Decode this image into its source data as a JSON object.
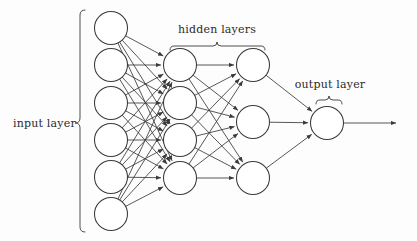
{
  "figure": {
    "background_color": "#fdfdfd",
    "stroke_color": "#3a3a3a",
    "node_fill": "#ffffff",
    "text_color": "#2b2b2b",
    "width": 417,
    "height": 241
  },
  "labels": {
    "input_layer": "input layer",
    "hidden_layers": "hidden layers",
    "output_layer": "output layer"
  },
  "chart_data": {
    "type": "diagram",
    "layers": [
      {
        "name": "input layer",
        "label": "input layer",
        "node_count": 6,
        "cx": 111,
        "radius": 16.5,
        "node_y": [
          28,
          65,
          103,
          140,
          177,
          214
        ]
      },
      {
        "name": "hidden layer 1",
        "label": "hidden layers",
        "node_count": 4,
        "cx": 180,
        "radius": 16.5,
        "node_y": [
          65,
          103,
          140,
          178
        ]
      },
      {
        "name": "hidden layer 2",
        "label": "hidden layers",
        "node_count": 3,
        "cx": 253,
        "radius": 16.5,
        "node_y": [
          65,
          122,
          178
        ]
      },
      {
        "name": "output layer",
        "label": "output layer",
        "node_count": 1,
        "cx": 327,
        "radius": 16.5,
        "node_y": [
          123
        ]
      }
    ],
    "connections": [
      {
        "from": "input layer",
        "to": "hidden layer 1",
        "pattern": "fully-connected",
        "edge_count": 24
      },
      {
        "from": "hidden layer 1",
        "to": "hidden layer 2",
        "pattern": "fully-connected",
        "edge_count": 12
      },
      {
        "from": "hidden layer 2",
        "to": "output layer",
        "pattern": "fully-connected",
        "edge_count": 3
      }
    ],
    "output_arrow": {
      "from_x": 344,
      "to_x": 396,
      "y": 123
    },
    "braces": [
      {
        "name": "input layer brace",
        "orientation": "vertical",
        "x": 80,
        "y1": 10,
        "y2": 232,
        "tip": 123
      },
      {
        "name": "hidden layers brace",
        "orientation": "horizontal",
        "y": 46,
        "x1": 170,
        "x2": 265,
        "tip": 217
      },
      {
        "name": "output layer brace",
        "orientation": "horizontal",
        "y": 100,
        "x1": 316,
        "x2": 342,
        "tip": 329
      }
    ],
    "label_positions": [
      {
        "text": "input layer",
        "x": 13,
        "y": 127,
        "anchor": "start"
      },
      {
        "text": "hidden layers",
        "x": 217,
        "y": 33,
        "anchor": "middle"
      },
      {
        "text": "output layer",
        "x": 330,
        "y": 88,
        "anchor": "middle"
      }
    ]
  }
}
